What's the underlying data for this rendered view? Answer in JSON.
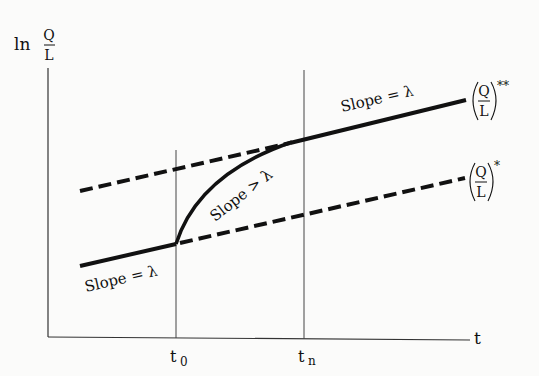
{
  "diagram": {
    "y_axis_label": {
      "prefix": "ln",
      "numerator": "Q",
      "denominator": "L"
    },
    "x_axis_label": "t",
    "x_ticks": [
      {
        "label": "t",
        "subscript": "0"
      },
      {
        "label": "t",
        "subscript": "n"
      }
    ],
    "annotations": {
      "lower_slope": "Slope = λ",
      "transition_slope": "Slope > λ",
      "upper_slope": "Slope = λ"
    },
    "curve_labels": {
      "upper": {
        "numerator": "Q",
        "denominator": "L",
        "superscript": "**"
      },
      "lower": {
        "numerator": "Q",
        "denominator": "L",
        "superscript": "*"
      }
    },
    "colors": {
      "line": "#111111",
      "background": "#fbfbfa"
    }
  }
}
